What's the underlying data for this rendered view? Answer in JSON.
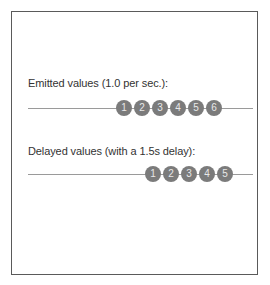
{
  "emitted": {
    "label": "Emitted values (1.0 per sec.):",
    "values": [
      "1",
      "2",
      "3",
      "4",
      "5",
      "6"
    ]
  },
  "delayed": {
    "label": "Delayed values (with a 1.5s delay):",
    "values": [
      "1",
      "2",
      "3",
      "4",
      "5"
    ]
  },
  "colors": {
    "marble": "#7b7b7b",
    "track": "#9a9a9a",
    "border": "#5a5a5a"
  }
}
